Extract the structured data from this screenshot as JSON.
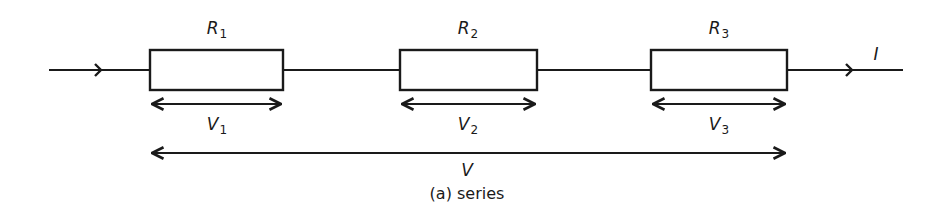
{
  "diagram": {
    "caption": "(a) series",
    "current_label": "I",
    "total_voltage_label": "V",
    "resistors": [
      {
        "symbol": "R",
        "sub": "1",
        "v_symbol": "V",
        "v_sub": "1"
      },
      {
        "symbol": "R",
        "sub": "2",
        "v_symbol": "V",
        "v_sub": "2"
      },
      {
        "symbol": "R",
        "sub": "3",
        "v_symbol": "V",
        "v_sub": "3"
      }
    ],
    "colors": {
      "stroke": "#1a1a1a",
      "background": "#ffffff"
    }
  }
}
